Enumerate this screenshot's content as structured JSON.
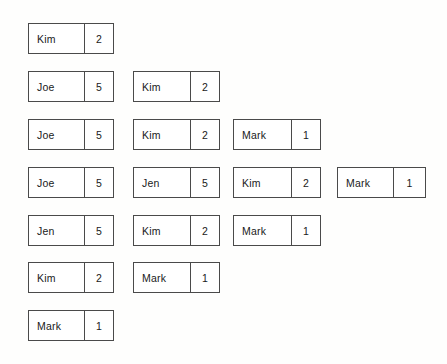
{
  "canvas": {
    "width": 447,
    "height": 364,
    "background": "#fefefd",
    "border_color": "#4a4a4a",
    "text_color": "#1a1a1a"
  },
  "layout": {
    "row_pitch": 48,
    "box_height": 31,
    "columns": [
      {
        "id": "column-1",
        "left": 28,
        "width": 86,
        "name_width": 56
      },
      {
        "id": "column-2",
        "left": 133,
        "width": 87,
        "name_width": 57
      },
      {
        "id": "column-3",
        "left": 233,
        "width": 88,
        "name_width": 58
      },
      {
        "id": "column-4",
        "left": 337,
        "width": 89,
        "name_width": 56
      }
    ],
    "rows": [
      23,
      71,
      119,
      167,
      215,
      262,
      310
    ]
  },
  "boxes": [
    {
      "name": "Kim",
      "value": "2",
      "column": 1,
      "row": 1,
      "left": 28,
      "top": 23,
      "width_class": "col-w1"
    },
    {
      "name": "Joe",
      "value": "5",
      "column": 1,
      "row": 2,
      "left": 28,
      "top": 71,
      "width_class": "col-w1"
    },
    {
      "name": "Kim",
      "value": "2",
      "column": 2,
      "row": 2,
      "left": 133,
      "top": 71,
      "width_class": "col-w2"
    },
    {
      "name": "Joe",
      "value": "5",
      "column": 1,
      "row": 3,
      "left": 28,
      "top": 119,
      "width_class": "col-w1"
    },
    {
      "name": "Kim",
      "value": "2",
      "column": 2,
      "row": 3,
      "left": 133,
      "top": 119,
      "width_class": "col-w2"
    },
    {
      "name": "Mark",
      "value": "1",
      "column": 3,
      "row": 3,
      "left": 233,
      "top": 119,
      "width_class": "col-w3"
    },
    {
      "name": "Joe",
      "value": "5",
      "column": 1,
      "row": 4,
      "left": 28,
      "top": 167,
      "width_class": "col-w1"
    },
    {
      "name": "Jen",
      "value": "5",
      "column": 2,
      "row": 4,
      "left": 133,
      "top": 167,
      "width_class": "col-w2"
    },
    {
      "name": "Kim",
      "value": "2",
      "column": 3,
      "row": 4,
      "left": 233,
      "top": 167,
      "width_class": "col-w3"
    },
    {
      "name": "Mark",
      "value": "1",
      "column": 4,
      "row": 4,
      "left": 337,
      "top": 167,
      "width_class": "col-w4"
    },
    {
      "name": "Jen",
      "value": "5",
      "column": 1,
      "row": 5,
      "left": 28,
      "top": 215,
      "width_class": "col-w1"
    },
    {
      "name": "Kim",
      "value": "2",
      "column": 2,
      "row": 5,
      "left": 133,
      "top": 215,
      "width_class": "col-w2"
    },
    {
      "name": "Mark",
      "value": "1",
      "column": 3,
      "row": 5,
      "left": 233,
      "top": 215,
      "width_class": "col-w3"
    },
    {
      "name": "Kim",
      "value": "2",
      "column": 1,
      "row": 6,
      "left": 28,
      "top": 262,
      "width_class": "col-w1"
    },
    {
      "name": "Mark",
      "value": "1",
      "column": 2,
      "row": 6,
      "left": 133,
      "top": 262,
      "width_class": "col-w2"
    },
    {
      "name": "Mark",
      "value": "1",
      "column": 1,
      "row": 7,
      "left": 28,
      "top": 310,
      "width_class": "col-w1"
    }
  ]
}
